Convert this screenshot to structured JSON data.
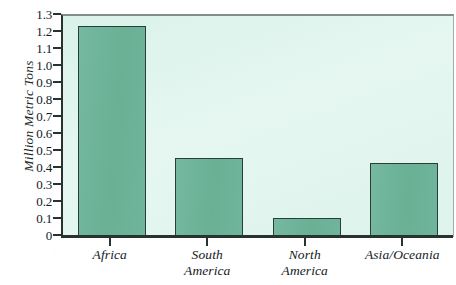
{
  "chart_data": {
    "type": "bar",
    "title": "",
    "xlabel": "",
    "ylabel": "Million Metric Tons",
    "categories": [
      "Africa",
      "South America",
      "North America",
      "Asia/Oceania"
    ],
    "values": [
      1.24,
      0.465,
      0.11,
      0.435
    ],
    "ylim": [
      0,
      1.3
    ],
    "ytick_labels": [
      "1.3",
      "1.2",
      "1.1",
      "1.0",
      "0.9",
      "0.8",
      "0.7",
      "0.6",
      "0.5",
      "0.4",
      "0.3",
      "0.2",
      "0.1",
      "0"
    ],
    "ytick_values": [
      1.3,
      1.2,
      1.1,
      1.0,
      0.9,
      0.8,
      0.7,
      0.6,
      0.5,
      0.4,
      0.3,
      0.2,
      0.1,
      0
    ],
    "grid": false,
    "legend": "none",
    "orientation": "vertical",
    "series": [
      {
        "name": "Million Metric Tons",
        "values": [
          1.24,
          0.465,
          0.11,
          0.435
        ]
      }
    ],
    "category_labels_wrapped": [
      {
        "line1": "Africa",
        "line2": ""
      },
      {
        "line1": "South",
        "line2": "America"
      },
      {
        "line1": "North",
        "line2": "America"
      },
      {
        "line1": "Asia/Oceania",
        "line2": ""
      }
    ]
  },
  "colors": {
    "bar_fill": "#6CB39A",
    "bar_border": "#2C3D39",
    "plot_background": "#DDF3EB",
    "axis_line": "#26332F",
    "text": "#13201E",
    "page_background": "#FFFFFF"
  },
  "title_fragment": {
    "text": "",
    "note_visible": ""
  }
}
